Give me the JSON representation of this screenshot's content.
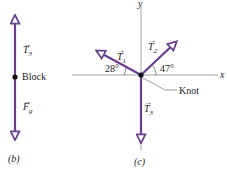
{
  "colors": {
    "vector": "#6a3d8f",
    "axis": "#8a8a8a",
    "text": "#222222"
  },
  "panel_b": {
    "caption": "(b)",
    "body_label": "Block",
    "vectors": [
      {
        "name": "T",
        "sub": "3",
        "direction": "up"
      },
      {
        "name": "F",
        "sub": "g",
        "direction": "down"
      }
    ]
  },
  "panel_c": {
    "caption": "(c)",
    "axis_x": "x",
    "axis_y": "y",
    "knot_label": "Knot",
    "vectors": [
      {
        "name": "T",
        "sub": "1",
        "angle_label": "28°"
      },
      {
        "name": "T",
        "sub": "2",
        "angle_label": "47°"
      },
      {
        "name": "T",
        "sub": "3",
        "direction": "down"
      }
    ]
  }
}
